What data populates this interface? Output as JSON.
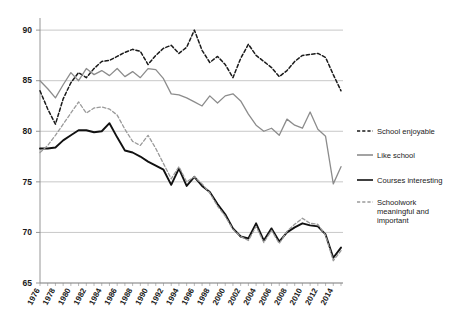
{
  "chart_data": {
    "type": "line",
    "title": "",
    "xlabel": "",
    "ylabel": "",
    "xlim": [
      1976,
      2015
    ],
    "ylim": [
      65,
      91
    ],
    "grid": true,
    "legend_position": "right",
    "y_ticks": [
      65,
      70,
      75,
      80,
      85,
      90
    ],
    "x_tick_labels": [
      "1976",
      "1978",
      "1980",
      "1982",
      "1984",
      "1986",
      "1988",
      "1990",
      "1992",
      "1994",
      "1996",
      "1998",
      "2000",
      "2002",
      "2004",
      "2006",
      "2008",
      "2010",
      "2012",
      "2014"
    ],
    "x_tick_values": [
      1976,
      1978,
      1980,
      1982,
      1984,
      1986,
      1988,
      1990,
      1992,
      1994,
      1996,
      1998,
      2000,
      2002,
      2004,
      2006,
      2008,
      2010,
      2012,
      2014
    ],
    "x": [
      1976,
      1977,
      1978,
      1979,
      1980,
      1981,
      1982,
      1983,
      1984,
      1985,
      1986,
      1987,
      1988,
      1989,
      1990,
      1991,
      1992,
      1993,
      1994,
      1995,
      1996,
      1997,
      1998,
      1999,
      2000,
      2001,
      2002,
      2003,
      2004,
      2005,
      2006,
      2007,
      2008,
      2009,
      2010,
      2011,
      2012,
      2013,
      2014,
      2015
    ],
    "series": [
      {
        "name": "School enjoyable",
        "color": "#1a1a1a",
        "style": "dashed",
        "width": 1.5,
        "values": [
          84.0,
          82.2,
          80.7,
          83.2,
          84.8,
          85.8,
          85.3,
          86.2,
          86.9,
          87.0,
          87.4,
          87.8,
          88.1,
          87.9,
          86.6,
          87.5,
          88.2,
          88.5,
          87.7,
          88.3,
          90.0,
          88.0,
          86.8,
          87.4,
          86.6,
          85.3,
          87.2,
          88.6,
          87.5,
          86.9,
          86.3,
          85.4,
          86.0,
          86.9,
          87.5,
          87.6,
          87.7,
          87.3,
          85.6,
          84.0
        ]
      },
      {
        "name": "Like school",
        "color": "#8c8c8c",
        "style": "solid",
        "width": 1.3,
        "values": [
          85.0,
          84.2,
          83.3,
          84.6,
          85.8,
          85.0,
          86.2,
          85.6,
          86.0,
          85.5,
          86.2,
          85.4,
          85.9,
          85.3,
          86.2,
          86.1,
          85.2,
          83.7,
          83.6,
          83.3,
          82.9,
          82.5,
          83.5,
          82.8,
          83.5,
          83.7,
          83.0,
          81.7,
          80.6,
          80.0,
          80.3,
          79.6,
          81.2,
          80.6,
          80.3,
          81.9,
          80.2,
          79.5,
          74.8,
          76.5
        ]
      },
      {
        "name": "Courses interesting",
        "color": "#111111",
        "style": "solid",
        "width": 1.9,
        "values": [
          78.3,
          78.3,
          78.4,
          79.1,
          79.6,
          80.1,
          80.1,
          79.9,
          80.0,
          80.8,
          79.4,
          78.1,
          77.9,
          77.5,
          77.0,
          76.6,
          76.2,
          74.7,
          76.3,
          74.6,
          75.5,
          74.6,
          74.0,
          72.8,
          71.8,
          70.4,
          69.6,
          69.4,
          70.9,
          69.2,
          70.4,
          69.1,
          70.0,
          70.5,
          70.9,
          70.7,
          70.6,
          69.8,
          67.5,
          68.5
        ]
      },
      {
        "name": "Schoolwork meaningful and important",
        "color": "#9a9a9a",
        "style": "dashed",
        "width": 1.3,
        "values": [
          77.9,
          78.6,
          79.6,
          80.7,
          81.8,
          82.9,
          81.8,
          82.3,
          82.4,
          82.2,
          81.6,
          80.2,
          79.0,
          78.6,
          79.6,
          78.3,
          76.8,
          75.3,
          76.5,
          75.0,
          75.5,
          74.8,
          73.9,
          72.6,
          71.6,
          70.3,
          69.6,
          69.2,
          70.6,
          69.0,
          70.2,
          68.9,
          70.1,
          70.8,
          71.4,
          70.9,
          70.8,
          69.7,
          67.2,
          68.2
        ]
      }
    ],
    "legend": [
      {
        "label": "School enjoyable",
        "color": "#1a1a1a",
        "style": "dashed"
      },
      {
        "label": "Like school",
        "color": "#8c8c8c",
        "style": "solid"
      },
      {
        "label": "Courses interesting",
        "color": "#111111",
        "style": "solid"
      },
      {
        "label": "Schoolwork meaningful and important",
        "color": "#9a9a9a",
        "style": "dashed"
      }
    ]
  }
}
